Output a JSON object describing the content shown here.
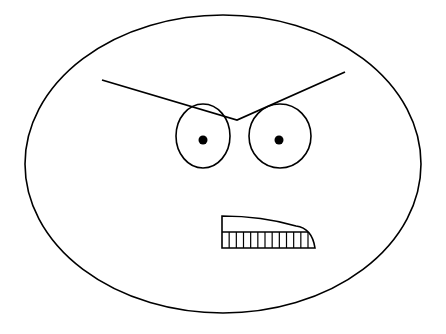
{
  "figure": {
    "stroke_color": "#000000",
    "background": "#ffffff",
    "face": {
      "cx": 223,
      "cy": 164,
      "rx": 198,
      "ry": 149
    },
    "eyebrows": {
      "points": "102,80 237,120 345,72"
    },
    "eyes": [
      {
        "cx": 203,
        "cy": 136,
        "rx": 27,
        "ry": 32,
        "pupil_cx": 203,
        "pupil_cy": 140,
        "pupil_r": 4.5
      },
      {
        "cx": 280,
        "cy": 136,
        "rx": 31,
        "ry": 32,
        "pupil_cx": 279,
        "pupil_cy": 140,
        "pupil_r": 4.5
      }
    ],
    "mouth": {
      "outline": "M222,216 L222,248 L315,248 Q312,228 296,226 Q262,216 222,216 Z",
      "teeth_line_y": 232,
      "teeth_count": 12,
      "teeth_x_start": 222,
      "teeth_x_end": 308
    }
  }
}
